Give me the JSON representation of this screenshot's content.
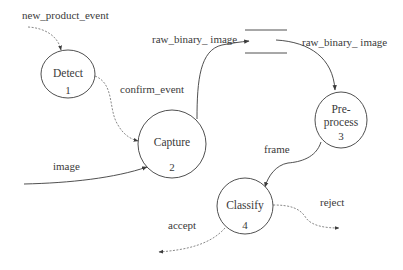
{
  "diagram": {
    "type": "data-flow-diagram",
    "processes": [
      {
        "id": 1,
        "name": "Detect",
        "number": "1",
        "cx": 68,
        "cy": 74,
        "rx": 27,
        "ry": 24
      },
      {
        "id": 2,
        "name": "Capture",
        "number": "2",
        "cx": 172,
        "cy": 144,
        "rx": 34,
        "ry": 34
      },
      {
        "id": 3,
        "name_line1": "Pre-",
        "name_line2": "process",
        "number": "3",
        "cx": 341,
        "cy": 120,
        "rx": 27,
        "ry": 28
      },
      {
        "id": 4,
        "name": "Classify",
        "number": "4",
        "cx": 245,
        "cy": 206,
        "rx": 28,
        "ry": 28
      }
    ],
    "data_store": {
      "x1": 245,
      "x2": 287,
      "y_top": 30,
      "y_bottom": 53,
      "label": ""
    },
    "flows": [
      {
        "label": "new_product_event",
        "from": "external",
        "to": "Detect",
        "style": "dashed"
      },
      {
        "label": "confirm_event",
        "from": "Detect",
        "to": "Capture",
        "style": "dashed"
      },
      {
        "label": "image",
        "from": "external",
        "to": "Capture",
        "style": "solid"
      },
      {
        "label": "raw_binary_ image",
        "from": "Capture",
        "to": "data_store",
        "style": "solid"
      },
      {
        "label": "raw_binary_ image",
        "from": "data_store",
        "to": "Pre-process",
        "style": "solid"
      },
      {
        "label": "frame",
        "from": "Pre-process",
        "to": "Classify",
        "style": "solid"
      },
      {
        "label": "accept",
        "from": "Classify",
        "to": "external",
        "style": "dashed"
      },
      {
        "label": "reject",
        "from": "Classify",
        "to": "external",
        "style": "dashed"
      }
    ],
    "colors": {
      "line": "#3c3c3c",
      "dashed_line": "#6a6a6a",
      "text": "#3a3a3a",
      "background": "#ffffff"
    }
  },
  "labels": {
    "new_product_event": "new_product_event",
    "confirm_event": "confirm_event",
    "image": "image",
    "raw_binary_in": "raw_binary_ image",
    "raw_binary_out": "raw_binary_ image",
    "frame": "frame",
    "accept": "accept",
    "reject": "reject"
  },
  "nodes": {
    "detect": {
      "name": "Detect",
      "number": "1"
    },
    "capture": {
      "name": "Capture",
      "number": "2"
    },
    "preprocess": {
      "line1": "Pre-",
      "line2": "process",
      "number": "3"
    },
    "classify": {
      "name": "Classify",
      "number": "4"
    }
  }
}
